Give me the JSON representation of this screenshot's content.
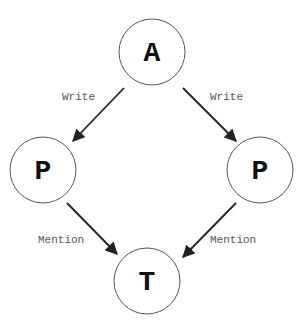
{
  "diagram": {
    "nodes": [
      {
        "id": "A",
        "label": "A",
        "cx": 152,
        "cy": 52,
        "r": 33
      },
      {
        "id": "P_left",
        "label": "P",
        "cx": 43,
        "cy": 170,
        "r": 33
      },
      {
        "id": "P_right",
        "label": "P",
        "cx": 260,
        "cy": 170,
        "r": 33
      },
      {
        "id": "T",
        "label": "T",
        "cx": 147,
        "cy": 281,
        "r": 33
      }
    ],
    "edges": [
      {
        "from": "A",
        "to": "P_left",
        "label": "Write"
      },
      {
        "from": "A",
        "to": "P_right",
        "label": "Write"
      },
      {
        "from": "P_left",
        "to": "T",
        "label": "Mention"
      },
      {
        "from": "P_right",
        "to": "T",
        "label": "Mention"
      }
    ]
  }
}
